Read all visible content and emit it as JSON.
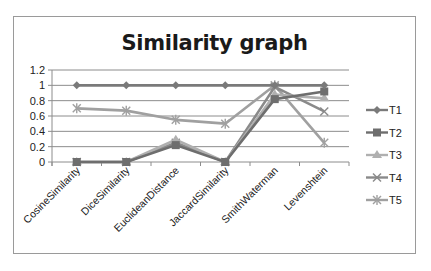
{
  "chart_data": {
    "type": "line",
    "title": "Similarity graph",
    "xlabel": "",
    "ylabel": "",
    "categories": [
      "CosineSimilarity",
      "DiceSimilarity",
      "EuclideanDistance",
      "JaccardSimilarity",
      "SmithWaterman",
      "Levenshtein"
    ],
    "ylim": [
      0,
      1.2
    ],
    "yticks": [
      "0",
      "0.2",
      "0.4",
      "0.6",
      "0.8",
      "1",
      "1.2"
    ],
    "grid": true,
    "legend_position": "right",
    "series": [
      {
        "name": "T1",
        "marker": "diamond",
        "color": "#7a7a7a",
        "values": [
          1,
          1,
          1,
          1,
          1,
          1
        ]
      },
      {
        "name": "T2",
        "marker": "square",
        "color": "#6e6e6e",
        "values": [
          0,
          0,
          0.22,
          0,
          0.82,
          0.92
        ]
      },
      {
        "name": "T3",
        "marker": "triangle",
        "color": "#b0b0b0",
        "values": [
          0,
          0,
          0.29,
          0,
          0.88,
          0.83
        ]
      },
      {
        "name": "T4",
        "marker": "x",
        "color": "#8a8a8a",
        "values": [
          0,
          0,
          0.25,
          0,
          0.98,
          0.66
        ]
      },
      {
        "name": "T5",
        "marker": "star",
        "color": "#a0a0a0",
        "values": [
          0.7,
          0.67,
          0.55,
          0.5,
          1.0,
          0.25
        ]
      }
    ]
  }
}
